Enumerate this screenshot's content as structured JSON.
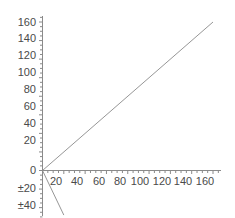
{
  "chart_data": {
    "type": "line",
    "title": "",
    "subtitle": "",
    "xlabel": "",
    "ylabel": "",
    "grid": false,
    "legend": "none",
    "xlim": [
      0,
      172
    ],
    "ylim": [
      -50,
      168
    ],
    "x_ticks": [
      20,
      40,
      60,
      80,
      100,
      120,
      140,
      160
    ],
    "x_tick_labels": [
      "20",
      "40",
      "60",
      "80",
      "100",
      "120",
      "140",
      "160"
    ],
    "y_ticks": [
      160,
      140,
      120,
      100,
      80,
      60,
      40,
      20,
      0,
      -20,
      -40
    ],
    "y_tick_labels": [
      "160",
      "140",
      "120",
      "100",
      "80",
      "60",
      "40",
      "20",
      "0",
      "±20",
      "±40"
    ],
    "y_minor_tick_interval": 5,
    "series": [
      {
        "name": "line-1",
        "color": "#8a8a8a",
        "x": [
          0,
          160
        ],
        "values": [
          0,
          160
        ],
        "slope": 1,
        "intercept": 0
      },
      {
        "name": "line-2",
        "color": "#8a8a8a",
        "x": [
          0,
          20
        ],
        "values": [
          0,
          -48
        ],
        "slope": -2.4,
        "intercept": 0
      }
    ],
    "axis_color": "#8a8a8a",
    "background_color": "#ffffff",
    "text_color": "#4a4a4a"
  },
  "axes": {
    "y_labels": [
      {
        "text": "160",
        "top": 17
      },
      {
        "text": "140",
        "top": 33
      },
      {
        "text": "120",
        "top": 50
      },
      {
        "text": "100",
        "top": 67
      },
      {
        "text": "80",
        "top": 84
      },
      {
        "text": "60",
        "top": 101
      },
      {
        "text": "40",
        "top": 118
      },
      {
        "text": "20",
        "top": 135
      },
      {
        "text": "0",
        "top": 165
      },
      {
        "text": "±20",
        "top": 183
      },
      {
        "text": "±40",
        "top": 200
      }
    ],
    "x_labels": [
      {
        "text": "20",
        "left": 56
      },
      {
        "text": "40",
        "left": 77
      },
      {
        "text": "60",
        "left": 99
      },
      {
        "text": "80",
        "left": 120
      },
      {
        "text": "100",
        "left": 140
      },
      {
        "text": "120",
        "left": 162
      },
      {
        "text": "140",
        "left": 183
      },
      {
        "text": "160",
        "left": 205
      }
    ]
  }
}
